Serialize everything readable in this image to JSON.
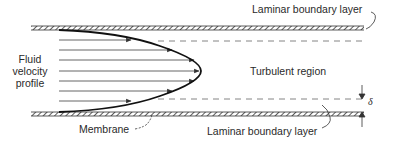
{
  "diagram": {
    "labels": {
      "profile_line1": "Fluid",
      "profile_line2": "velocity",
      "profile_line3": "profile",
      "laminar_top": "Laminar boundary layer",
      "turbulent": "Turbulent region",
      "laminar_bottom": "Laminar boundary layer",
      "membrane": "Membrane",
      "delta": "δ"
    },
    "elements": {
      "top_wall": "hatched channel wall",
      "bottom_wall": "hatched membrane surface",
      "boundary_lines": "dashed laminar/turbulent boundaries",
      "velocity_arrows": 7,
      "profile_shape": "parabolic"
    },
    "colors": {
      "stroke": "#1a1a1a",
      "arrow": "#555555",
      "text": "#2a2a2a",
      "dash": "#777777"
    }
  }
}
